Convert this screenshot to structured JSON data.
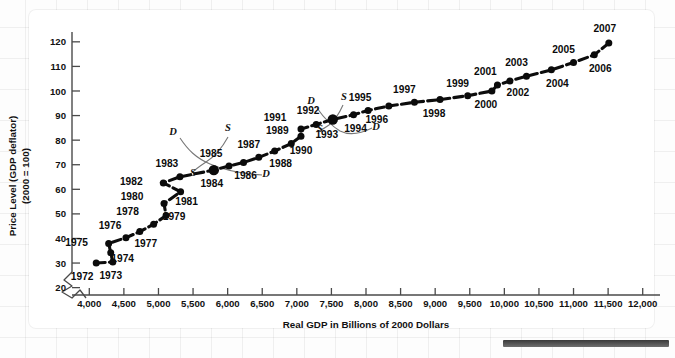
{
  "chart_data": {
    "type": "scatter",
    "title": "",
    "xlabel": "Real GDP in Billions of 2000 Dollars",
    "ylabel_line1": "Price Level (GDP deflator)",
    "ylabel_line2": "(2000 = 100)",
    "xlim": [
      3750,
      12250
    ],
    "ylim": [
      17,
      124
    ],
    "xticks": [
      "4,000",
      "4,500",
      "5,000",
      "5,500",
      "6,000",
      "6,500",
      "7,000",
      "7,500",
      "8,000",
      "8,500",
      "9,000",
      "9,500",
      "10,000",
      "10,500",
      "11,000",
      "11,500",
      "12,000"
    ],
    "xtick_values": [
      4000,
      4500,
      5000,
      5500,
      6000,
      6500,
      7000,
      7500,
      8000,
      8500,
      9000,
      9500,
      10000,
      10500,
      11000,
      11500,
      12000
    ],
    "yticks": [
      "20",
      "30",
      "40",
      "50",
      "60",
      "70",
      "80",
      "90",
      "100",
      "110",
      "120"
    ],
    "ytick_values": [
      20,
      30,
      40,
      50,
      60,
      70,
      80,
      90,
      100,
      110,
      120
    ],
    "grid": false,
    "legend": "none",
    "axis_break": true,
    "series": [
      {
        "name": "U.S. macroeconomic equilibrium 1972-2007",
        "points": [
          {
            "label": "1972",
            "x": 4100,
            "y": 30.0,
            "lx": -14,
            "ly": 17,
            "big": false
          },
          {
            "label": "1973",
            "x": 4340,
            "y": 30.4,
            "lx": -2,
            "ly": 17,
            "big": false
          },
          {
            "label": "1974",
            "x": 4310,
            "y": 34.2,
            "lx": 12,
            "ly": 9,
            "big": false
          },
          {
            "label": "1975",
            "x": 4280,
            "y": 38.0,
            "lx": -32,
            "ly": 3,
            "big": false
          },
          {
            "label": "1976",
            "x": 4530,
            "y": 40.3,
            "lx": -16,
            "ly": -9,
            "big": false
          },
          {
            "label": "1977",
            "x": 4730,
            "y": 42.8,
            "lx": 6,
            "ly": 15,
            "big": false
          },
          {
            "label": "1978",
            "x": 4930,
            "y": 45.8,
            "lx": -26,
            "ly": -9,
            "big": false
          },
          {
            "label": "1979",
            "x": 5110,
            "y": 49.3,
            "lx": 8,
            "ly": 4,
            "big": false
          },
          {
            "label": "1980",
            "x": 5080,
            "y": 54.2,
            "lx": -32,
            "ly": -4,
            "big": false
          },
          {
            "label": "1981",
            "x": 5320,
            "y": 59.0,
            "lx": 6,
            "ly": 13,
            "big": false
          },
          {
            "label": "1982",
            "x": 5070,
            "y": 62.6,
            "lx": -32,
            "ly": 2,
            "big": false
          },
          {
            "label": "1983",
            "x": 5310,
            "y": 65.1,
            "lx": -13,
            "ly": -10,
            "big": false
          },
          {
            "label": "1984",
            "x": 5800,
            "y": 67.8,
            "lx": -2,
            "ly": 17,
            "big": true
          },
          {
            "label": "1985",
            "x": 6020,
            "y": 69.5,
            "lx": -18,
            "ly": -9,
            "big": false
          },
          {
            "label": "1986",
            "x": 6230,
            "y": 70.9,
            "lx": 2,
            "ly": 16,
            "big": false
          },
          {
            "label": "1987",
            "x": 6450,
            "y": 73.0,
            "lx": -10,
            "ly": -9,
            "big": false
          },
          {
            "label": "1988",
            "x": 6680,
            "y": 75.6,
            "lx": 6,
            "ly": 16,
            "big": false
          },
          {
            "label": "1989",
            "x": 6920,
            "y": 78.6,
            "lx": -14,
            "ly": -10,
            "big": false
          },
          {
            "label": "1990",
            "x": 7060,
            "y": 81.6,
            "lx": 0,
            "ly": 18,
            "big": false
          },
          {
            "label": "1991",
            "x": 7060,
            "y": 84.5,
            "lx": -26,
            "ly": -8,
            "big": false
          },
          {
            "label": "1992",
            "x": 7280,
            "y": 86.4,
            "lx": -8,
            "ly": -10,
            "big": false
          },
          {
            "label": "1993",
            "x": 7520,
            "y": 88.4,
            "lx": -6,
            "ly": 18,
            "big": true
          },
          {
            "label": "1994",
            "x": 7820,
            "y": 90.3,
            "lx": 2,
            "ly": 17,
            "big": false
          },
          {
            "label": "1995",
            "x": 8030,
            "y": 92.1,
            "lx": -8,
            "ly": -9,
            "big": false
          },
          {
            "label": "1996",
            "x": 8330,
            "y": 93.9,
            "lx": -12,
            "ly": 17,
            "big": false
          },
          {
            "label": "1997",
            "x": 8700,
            "y": 95.4,
            "lx": -10,
            "ly": -9,
            "big": false
          },
          {
            "label": "1998",
            "x": 9070,
            "y": 96.5,
            "lx": -6,
            "ly": 17,
            "big": false
          },
          {
            "label": "1999",
            "x": 9470,
            "y": 98.1,
            "lx": -10,
            "ly": -9,
            "big": false
          },
          {
            "label": "2000",
            "x": 9820,
            "y": 100.0,
            "lx": -6,
            "ly": 17,
            "big": false
          },
          {
            "label": "2001",
            "x": 9900,
            "y": 102.4,
            "lx": -12,
            "ly": -10,
            "big": false
          },
          {
            "label": "2002",
            "x": 10080,
            "y": 104.1,
            "lx": 8,
            "ly": 15,
            "big": false
          },
          {
            "label": "2003",
            "x": 10320,
            "y": 106.0,
            "lx": -10,
            "ly": -10,
            "big": false
          },
          {
            "label": "2004",
            "x": 10680,
            "y": 108.6,
            "lx": 6,
            "ly": 17,
            "big": false
          },
          {
            "label": "2005",
            "x": 11000,
            "y": 111.6,
            "lx": -10,
            "ly": -10,
            "big": false
          },
          {
            "label": "2006",
            "x": 11300,
            "y": 114.7,
            "lx": 6,
            "ly": 17,
            "big": false
          },
          {
            "label": "2007",
            "x": 11510,
            "y": 119.5,
            "lx": -4,
            "ly": -11,
            "big": false
          }
        ]
      }
    ],
    "annotations": [
      {
        "text": "D",
        "group": "1984-cross",
        "x": 173,
        "y": 135
      },
      {
        "text": "S",
        "group": "1984-cross",
        "x": 228,
        "y": 131
      },
      {
        "text": "S",
        "group": "1984-cross",
        "x": 193,
        "y": 176
      },
      {
        "text": "D",
        "group": "1984-cross",
        "x": 266,
        "y": 177
      },
      {
        "text": "D",
        "group": "1993-cross",
        "x": 311,
        "y": 104
      },
      {
        "text": "S",
        "group": "1993-cross",
        "x": 344,
        "y": 100
      },
      {
        "text": "S",
        "group": "1993-cross",
        "x": 320,
        "y": 132
      },
      {
        "text": "D",
        "group": "1993-cross",
        "x": 376,
        "y": 130
      }
    ]
  }
}
